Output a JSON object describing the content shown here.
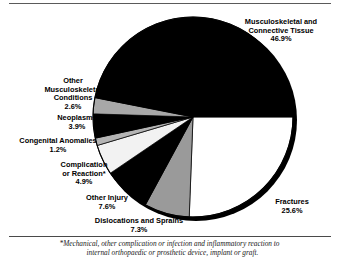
{
  "figure": {
    "footnote_line_1": "*Mechanical, other complication or infection and inflammatory reaction to",
    "footnote_line_2": "internal orthopaedic or prosthetic device, implant or graft."
  },
  "chart_data": {
    "type": "pie",
    "title": "",
    "units": "percent",
    "start_angle_deg": 0,
    "direction": "clockwise",
    "legend": "labels-outside",
    "slices": [
      {
        "label": "Musculoskeletal and",
        "label_line_2": "Connective Tissue",
        "label_full": "Musculoskeletal and Connective Tissue",
        "value": 46.9,
        "value_text": "46.9%",
        "color": "#000000"
      },
      {
        "label": "Fractures",
        "label_line_2": "",
        "label_full": "Fractures",
        "value": 25.6,
        "value_text": "25.6%",
        "color": "#ffffff"
      },
      {
        "label": "Dislocations and Sprains",
        "label_line_2": "",
        "label_full": "Dislocations and Sprains",
        "value": 7.3,
        "value_text": "7.3%",
        "color": "#9a9a9a"
      },
      {
        "label": "Other Injury",
        "label_line_2": "",
        "label_full": "Other Injury",
        "value": 7.6,
        "value_text": "7.6%",
        "color": "#000000"
      },
      {
        "label": "Complication",
        "label_line_2": "or Reaction*",
        "label_full": "Complication or Reaction*",
        "value": 4.9,
        "value_text": "4.9%",
        "color": "#f2f2f2"
      },
      {
        "label": "Congenital Anomalies",
        "label_line_2": "",
        "label_full": "Congenital Anomalies",
        "value": 1.2,
        "value_text": "1.2%",
        "color": "#b4b4b4"
      },
      {
        "label": "Neoplasms",
        "label_line_2": "",
        "label_full": "Neoplasms",
        "value": 3.9,
        "value_text": "3.9%",
        "color": "#000000"
      },
      {
        "label": "Other",
        "label_line_2": "Musculoskeletal",
        "label_line_3": "Conditions",
        "label_full": "Other Musculoskeletal Conditions",
        "value": 2.6,
        "value_text": "2.6%",
        "color": "#a8a8a8"
      }
    ]
  }
}
